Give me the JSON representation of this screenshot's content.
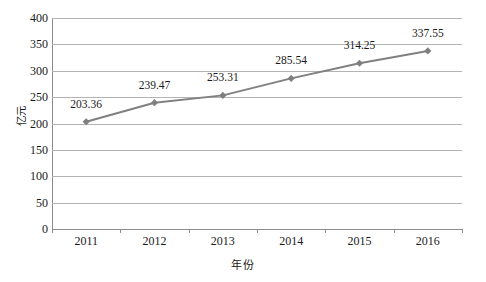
{
  "chart_data": {
    "type": "line",
    "title": "",
    "xlabel": "年份",
    "ylabel": "亿元",
    "categories": [
      "2011",
      "2012",
      "2013",
      "2014",
      "2015",
      "2016"
    ],
    "values": [
      203.36,
      239.47,
      253.31,
      285.54,
      314.25,
      337.55
    ],
    "data_labels": [
      "203.36",
      "239.47",
      "253.31",
      "285.54",
      "314.25",
      "337.55"
    ],
    "ylim": [
      0,
      400
    ],
    "y_ticks": [
      "400",
      "350",
      "300",
      "250",
      "200",
      "150",
      "100",
      "50",
      "0"
    ],
    "y_tick_values": [
      400,
      350,
      300,
      250,
      200,
      150,
      100,
      50,
      0
    ],
    "grid": "horizontal",
    "legend": "none",
    "series": [
      {
        "name": "",
        "values": [
          203.36,
          239.47,
          253.31,
          285.54,
          314.25,
          337.55
        ],
        "line_color": "#808080",
        "marker_color": "#7f7f7f",
        "marker": "diamond"
      }
    ],
    "colors": {
      "line": "#808080",
      "marker": "#7f7f7f",
      "gridline": "#b3b3b3",
      "axis": "#8c8c8c",
      "text": "#1a1a1a",
      "background": "#ffffff"
    }
  }
}
